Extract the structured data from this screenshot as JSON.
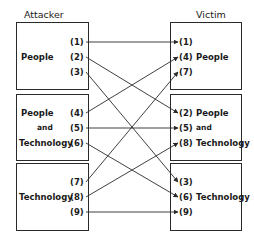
{
  "attacker": {
    "title": "Attacker",
    "groups": [
      {
        "label": "People",
        "items": [
          "(1)",
          "(2)",
          "(3)"
        ]
      },
      {
        "label_lines": [
          "People",
          "and",
          "Technology"
        ],
        "items": [
          "(4)",
          "(5)",
          "(6)"
        ]
      },
      {
        "label": "Technology",
        "items": [
          "(7)",
          "(8)",
          "(9)"
        ]
      }
    ]
  },
  "victim": {
    "title": "Victim",
    "groups": [
      {
        "label": "People",
        "items": [
          "(1)",
          "(4)",
          "(7)"
        ]
      },
      {
        "label_lines": [
          "People",
          "and",
          "Technology"
        ],
        "items": [
          "(2)",
          "(5)",
          "(8)"
        ]
      },
      {
        "label": "Technology",
        "items": [
          "(3)",
          "(6)",
          "(9)"
        ]
      }
    ]
  },
  "connections": [
    {
      "from": "(1)",
      "to": "(1)"
    },
    {
      "from": "(2)",
      "to": "(2)"
    },
    {
      "from": "(3)",
      "to": "(3)"
    },
    {
      "from": "(4)",
      "to": "(4)"
    },
    {
      "from": "(5)",
      "to": "(5)"
    },
    {
      "from": "(6)",
      "to": "(6)"
    },
    {
      "from": "(7)",
      "to": "(7)"
    },
    {
      "from": "(8)",
      "to": "(8)"
    },
    {
      "from": "(9)",
      "to": "(9)"
    }
  ]
}
